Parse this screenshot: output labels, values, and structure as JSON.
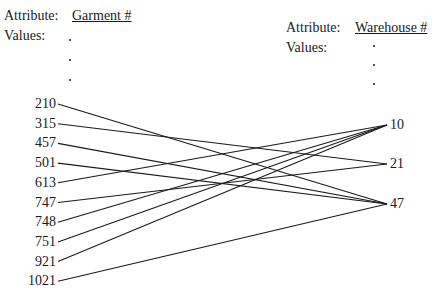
{
  "left": {
    "attribute_label": "Attribute:",
    "attribute_name": "Garment #",
    "values_label": "Values:",
    "values": [
      "210",
      "315",
      "457",
      "501",
      "613",
      "747",
      "748",
      "751",
      "921",
      "1021"
    ]
  },
  "right": {
    "attribute_label": "Attribute:",
    "attribute_name": "Warehouse #",
    "values_label": "Values:",
    "values": [
      "10",
      "21",
      "47"
    ]
  },
  "mappings": [
    {
      "from": "210",
      "to": "47"
    },
    {
      "from": "315",
      "to": "21"
    },
    {
      "from": "457",
      "to": "47"
    },
    {
      "from": "501",
      "to": "47"
    },
    {
      "from": "613",
      "to": "10"
    },
    {
      "from": "747",
      "to": "21"
    },
    {
      "from": "748",
      "to": "10"
    },
    {
      "from": "751",
      "to": "10"
    },
    {
      "from": "921",
      "to": "10"
    },
    {
      "from": "1021",
      "to": "47"
    }
  ]
}
